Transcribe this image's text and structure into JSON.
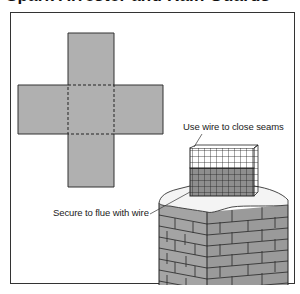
{
  "title": "Spark Arrester and Rain Guards",
  "diagram": {
    "template": {
      "shape": "cross-pattern",
      "fill": "#b0b0b0",
      "fold_lines": "dashed"
    },
    "labels": {
      "seams": "Use wire to close seams",
      "secure": "Secure to flue with wire"
    },
    "colors": {
      "panel": "#b0b0b0",
      "brick": "#9c9c9c",
      "mortar": "#333333",
      "snow": "#f4f4f4",
      "mesh": "#222222"
    }
  }
}
